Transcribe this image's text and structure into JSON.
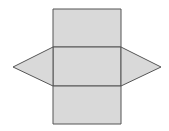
{
  "diagram": {
    "fill_color": "#d9d9d9",
    "stroke_color": "#555555",
    "faces": [
      {
        "name": "top-rectangle",
        "points": "53,9 121,9 121,47 53,47"
      },
      {
        "name": "middle-rectangle",
        "points": "53,47 121,47 121,86 53,86"
      },
      {
        "name": "bottom-rectangle",
        "points": "53,86 121,86 121,124 53,124"
      },
      {
        "name": "left-triangle",
        "points": "53,47 13,67 53,86"
      },
      {
        "name": "right-triangle",
        "points": "121,47 161,67 121,86"
      }
    ]
  }
}
